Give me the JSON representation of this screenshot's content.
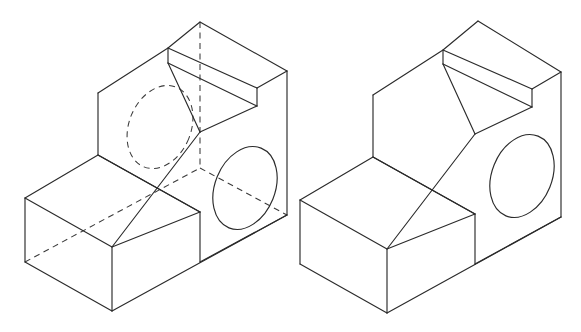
{
  "document": {
    "type": "isometric-technical-drawing",
    "title": "Stepped Block Isometric Views",
    "background_color": "#ffffff",
    "width": 581,
    "height": 332
  },
  "style": {
    "visible_line_color": "#2b2b2b",
    "hidden_line_color": "#3a3a3a",
    "visible_line_width": 1.15,
    "hidden_line_width": 1.05,
    "hidden_dash_pattern": "6 4.5",
    "face_fill": "#ffffff"
  },
  "figures": [
    {
      "id": "left-figure",
      "name": "stepped-block-with-hidden-lines",
      "label": "",
      "shows_hidden_lines": true,
      "origin": {
        "x": 0,
        "y": 0
      },
      "vertices": {
        "base_front_left_top": {
          "x": 25,
          "y": 198
        },
        "base_front_left_bottom": {
          "x": 25,
          "y": 262
        },
        "base_front_mid_top": {
          "x": 112,
          "y": 247
        },
        "base_front_mid_bottom": {
          "x": 112,
          "y": 311
        },
        "base_back_left_top": {
          "x": 98,
          "y": 155
        },
        "base_step_top_right": {
          "x": 200,
          "y": 212
        },
        "base_right_front_top": {
          "x": 200,
          "y": 212
        },
        "base_right_front_bottom": {
          "x": 200,
          "y": 262
        },
        "base_far_right_top": {
          "x": 287,
          "y": 168
        },
        "base_far_right_bottom": {
          "x": 287,
          "y": 215
        },
        "upper_front_left_top": {
          "x": 98,
          "y": 93
        },
        "upper_front_left_bottom": {
          "x": 98,
          "y": 155
        },
        "upper_top_left": {
          "x": 168,
          "y": 48
        },
        "upper_top_apex": {
          "x": 200,
          "y": 22
        },
        "slab_top_right": {
          "x": 287,
          "y": 71
        },
        "slab_front_right": {
          "x": 287,
          "y": 88
        },
        "slab_inner_right": {
          "x": 257,
          "y": 106
        },
        "slab_inner_left": {
          "x": 168,
          "y": 63
        },
        "step_face_right": {
          "x": 200,
          "y": 132
        }
      },
      "holes": [
        {
          "name": "through-hole-front-face-hidden",
          "style": "hidden",
          "center": {
            "x": 160,
            "y": 127
          },
          "rx": 31,
          "ry": 43,
          "rotation_deg": 22
        },
        {
          "name": "through-hole-right-face-visible",
          "style": "visible",
          "center": {
            "x": 245,
            "y": 188
          },
          "rx": 30,
          "ry": 43,
          "rotation_deg": 22
        }
      ],
      "hidden_edges": [
        {
          "name": "vertical-back-corner",
          "from": {
            "x": 200,
            "y": 22
          },
          "to": {
            "x": 200,
            "y": 168
          }
        },
        {
          "name": "back-bottom-left-diagonal",
          "from": {
            "x": 25,
            "y": 262
          },
          "to": {
            "x": 200,
            "y": 168
          }
        },
        {
          "name": "back-bottom-right-diagonal",
          "from": {
            "x": 200,
            "y": 168
          },
          "to": {
            "x": 287,
            "y": 215
          }
        }
      ]
    },
    {
      "id": "right-figure",
      "name": "stepped-block-visible-only",
      "label": "",
      "shows_hidden_lines": false,
      "origin": {
        "x": 290,
        "y": 0
      },
      "vertices": {
        "base_front_left_top": {
          "x": 300,
          "y": 200
        },
        "base_front_left_bottom": {
          "x": 300,
          "y": 264
        },
        "base_front_mid_top": {
          "x": 387,
          "y": 249
        },
        "base_front_mid_bottom": {
          "x": 387,
          "y": 313
        },
        "base_back_left_top": {
          "x": 373,
          "y": 157
        },
        "base_right_front_top": {
          "x": 475,
          "y": 214
        },
        "base_right_front_bottom": {
          "x": 475,
          "y": 264
        },
        "base_far_right_top": {
          "x": 561,
          "y": 170
        },
        "base_far_right_bottom": {
          "x": 561,
          "y": 217
        },
        "upper_front_left_top": {
          "x": 373,
          "y": 95
        },
        "upper_front_left_bottom": {
          "x": 373,
          "y": 157
        },
        "upper_top_left": {
          "x": 443,
          "y": 50
        },
        "upper_top_apex": {
          "x": 478,
          "y": 21
        },
        "slab_top_right": {
          "x": 561,
          "y": 72
        },
        "slab_front_right": {
          "x": 561,
          "y": 89
        },
        "slab_inner_right": {
          "x": 532,
          "y": 107
        },
        "slab_inner_left": {
          "x": 443,
          "y": 64
        },
        "step_face_right": {
          "x": 475,
          "y": 134
        }
      },
      "holes": [
        {
          "name": "through-hole-right-face-visible",
          "style": "visible",
          "center": {
            "x": 522,
            "y": 176
          },
          "rx": 30,
          "ry": 43,
          "rotation_deg": 22
        }
      ],
      "hidden_edges": []
    }
  ]
}
